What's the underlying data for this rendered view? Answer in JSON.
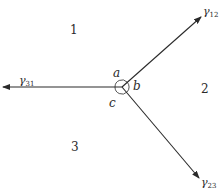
{
  "diagram": {
    "center": {
      "x": 122,
      "y": 87
    },
    "colors": {
      "line": "#2a2a2a",
      "background": "#ffffff"
    },
    "regions": [
      {
        "label": "1",
        "x": 70,
        "y": 34
      },
      {
        "label": "2",
        "x": 201,
        "y": 93
      },
      {
        "label": "3",
        "x": 71,
        "y": 151
      }
    ],
    "angles": [
      {
        "label": "a",
        "x": 113,
        "y": 77
      },
      {
        "label": "b",
        "x": 133,
        "y": 90
      },
      {
        "label": "c",
        "x": 109,
        "y": 107
      }
    ],
    "rays": [
      {
        "name": "gamma-12",
        "symbol": "γ",
        "subscript": "12",
        "end": {
          "x": 201,
          "y": 17
        },
        "label_x": 204,
        "label_y": 15
      },
      {
        "name": "gamma-31",
        "symbol": "γ",
        "subscript": "31",
        "end": {
          "x": 3,
          "y": 87
        },
        "label_x": 18,
        "label_y": 84
      },
      {
        "name": "gamma-23",
        "symbol": "γ",
        "subscript": "23",
        "end": {
          "x": 199,
          "y": 178
        },
        "label_x": 202,
        "label_y": 185
      }
    ]
  }
}
